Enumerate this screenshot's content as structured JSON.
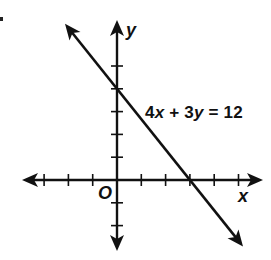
{
  "chart_data": {
    "type": "line",
    "title": "",
    "xlabel": "x",
    "ylabel": "y",
    "origin_label": "O",
    "equation": "4x + 3y = 12",
    "equation_parts": {
      "a": "4",
      "xvar": "x",
      "plus": " + ",
      "b": "3",
      "yvar": "y",
      "eq": " = ",
      "c": "12"
    },
    "xlim": [
      -4,
      6
    ],
    "ylim": [
      -3,
      6
    ],
    "x_ticks": [
      -3,
      -2,
      -1,
      1,
      2,
      3,
      4,
      5
    ],
    "y_ticks": [
      -2,
      -1,
      1,
      2,
      3,
      4,
      5
    ],
    "grid": false,
    "series": [
      {
        "name": "4x + 3y = 12",
        "slope": -1.3333,
        "y_intercept": 4,
        "x_intercept": 3,
        "points": [
          [
            -2.2,
            6.93
          ],
          [
            0,
            4
          ],
          [
            3,
            0
          ],
          [
            5.3,
            -3.07
          ]
        ]
      }
    ],
    "annotations": [
      {
        "text": "4x + 3y = 12",
        "position": "right of line, near y-intercept"
      }
    ]
  },
  "labels": {
    "x": "x",
    "y": "y",
    "origin": "O"
  }
}
